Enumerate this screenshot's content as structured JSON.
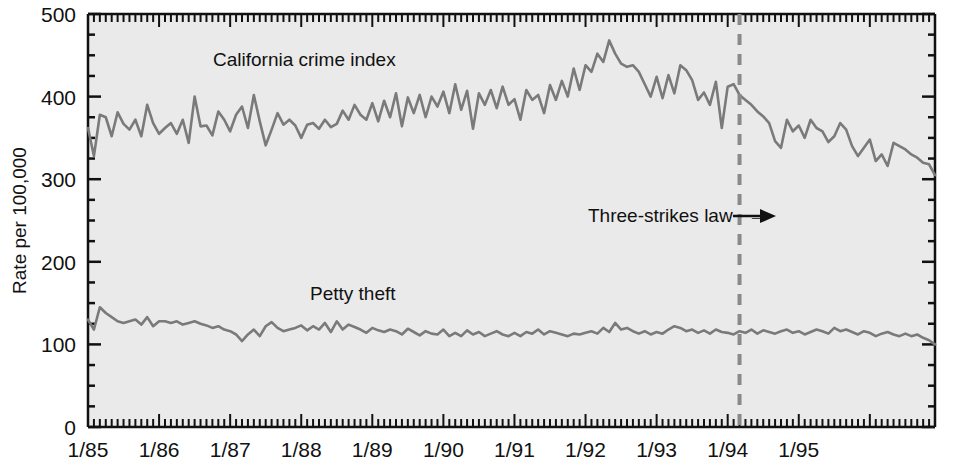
{
  "chart_data": {
    "type": "line",
    "title": "",
    "xlabel": "",
    "ylabel": "Rate per 100,000",
    "ylim": [
      0,
      500
    ],
    "yticks": [
      0,
      100,
      200,
      300,
      400,
      500
    ],
    "ytick_labels": [
      "0",
      "100",
      "200",
      "300",
      "400",
      "500"
    ],
    "y_minor_step": 25,
    "xlim": [
      "1/85",
      "12/96"
    ],
    "xticks": [
      "1/85",
      "1/86",
      "1/87",
      "1/88",
      "1/89",
      "1/90",
      "1/91",
      "1/92",
      "1/93",
      "1/94",
      "1/95"
    ],
    "x_minor": "monthly",
    "grid": false,
    "legend": "inline-annotations",
    "plot_background": "#eaeaea",
    "line_color": "#7a7a7a",
    "axis_color": "#111111",
    "annotations": [
      {
        "name": "california-crime-index-label",
        "text": "California crime index",
        "x_px": 213,
        "y_px": 66
      },
      {
        "name": "petty-theft-label",
        "text": "Petty theft",
        "x_px": 310,
        "y_px": 300
      },
      {
        "name": "three-strikes-label",
        "text": "Three-strikes law",
        "x_px": 588,
        "y_px": 222
      },
      {
        "name": "three-strikes-arrow",
        "text": "→",
        "x_px": 748,
        "y_px": 222
      }
    ],
    "event_marker": {
      "name": "three-strikes-law-line",
      "label": "Three-strikes law",
      "date": "3/94",
      "style": "dashed-vertical",
      "color": "#8a8a8a"
    },
    "series": [
      {
        "name": "California crime index",
        "color": "#7a7a7a",
        "start": "1/85",
        "values": [
          362,
          328,
          378,
          375,
          352,
          381,
          367,
          360,
          372,
          352,
          390,
          368,
          355,
          362,
          368,
          355,
          372,
          344,
          400,
          364,
          365,
          353,
          382,
          372,
          358,
          378,
          388,
          362,
          402,
          370,
          341,
          360,
          380,
          366,
          372,
          365,
          350,
          366,
          368,
          361,
          372,
          363,
          367,
          383,
          372,
          390,
          378,
          372,
          392,
          370,
          395,
          375,
          404,
          364,
          399,
          380,
          402,
          375,
          400,
          388,
          406,
          380,
          415,
          384,
          407,
          361,
          404,
          390,
          408,
          386,
          412,
          390,
          397,
          372,
          408,
          396,
          402,
          380,
          414,
          396,
          419,
          400,
          434,
          408,
          438,
          430,
          452,
          442,
          468,
          452,
          440,
          436,
          438,
          430,
          415,
          400,
          424,
          398,
          426,
          404,
          438,
          432,
          420,
          396,
          405,
          390,
          418,
          362,
          412,
          415,
          402,
          396,
          390,
          382,
          376,
          368,
          346,
          338,
          372,
          358,
          365,
          350,
          372,
          362,
          358,
          345,
          352,
          368,
          360,
          340,
          328,
          338,
          348,
          322,
          330,
          316,
          344,
          340,
          336,
          330,
          326,
          320,
          318,
          305
        ]
      },
      {
        "name": "Petty theft",
        "color": "#7a7a7a",
        "start": "1/85",
        "values": [
          130,
          118,
          145,
          138,
          133,
          128,
          126,
          128,
          130,
          124,
          133,
          122,
          128,
          128,
          126,
          128,
          124,
          126,
          128,
          125,
          123,
          120,
          122,
          118,
          116,
          112,
          104,
          112,
          118,
          110,
          122,
          127,
          120,
          116,
          118,
          120,
          123,
          117,
          122,
          118,
          126,
          115,
          128,
          118,
          124,
          121,
          118,
          114,
          120,
          117,
          115,
          118,
          116,
          112,
          119,
          115,
          111,
          116,
          113,
          112,
          118,
          110,
          114,
          110,
          117,
          112,
          115,
          110,
          113,
          116,
          112,
          110,
          114,
          110,
          115,
          113,
          118,
          112,
          116,
          114,
          112,
          110,
          113,
          112,
          114,
          116,
          113,
          120,
          115,
          126,
          118,
          120,
          116,
          113,
          116,
          112,
          115,
          113,
          118,
          122,
          120,
          116,
          118,
          114,
          117,
          113,
          118,
          115,
          114,
          112,
          116,
          114,
          118,
          113,
          117,
          115,
          113,
          116,
          118,
          114,
          116,
          112,
          115,
          118,
          116,
          113,
          120,
          116,
          118,
          115,
          112,
          116,
          114,
          110,
          113,
          115,
          112,
          110,
          113,
          110,
          112,
          108,
          105,
          100
        ]
      }
    ]
  }
}
